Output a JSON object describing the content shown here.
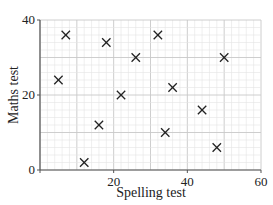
{
  "chart_data": {
    "type": "scatter",
    "title": "",
    "xlabel": "Spelling test",
    "ylabel": "Maths test",
    "xlim": [
      0,
      60
    ],
    "ylim": [
      0,
      40
    ],
    "x_ticks": [
      0,
      20,
      40,
      60
    ],
    "y_ticks": [
      0,
      20,
      40
    ],
    "x_tick_labels": [
      "20",
      "40",
      "60"
    ],
    "y_tick_labels": [
      "0",
      "20",
      "40"
    ],
    "grid": true,
    "grid_minor_step": 2,
    "grid_major_step": 10,
    "marker": "x",
    "legend": null,
    "points": [
      {
        "x": 5,
        "y": 24
      },
      {
        "x": 7,
        "y": 36
      },
      {
        "x": 12,
        "y": 2
      },
      {
        "x": 16,
        "y": 12
      },
      {
        "x": 18,
        "y": 34
      },
      {
        "x": 22,
        "y": 20
      },
      {
        "x": 26,
        "y": 30
      },
      {
        "x": 32,
        "y": 36
      },
      {
        "x": 34,
        "y": 10
      },
      {
        "x": 36,
        "y": 22
      },
      {
        "x": 44,
        "y": 16
      },
      {
        "x": 48,
        "y": 6
      },
      {
        "x": 50,
        "y": 30
      }
    ]
  },
  "colors": {
    "minor_grid": "#e4e4e4",
    "major_grid": "#c8c8c8",
    "axis": "#555555",
    "marker": "#222222"
  },
  "layout": {
    "plot_left": 40,
    "plot_right": 261,
    "plot_top": 20,
    "plot_bottom": 170
  }
}
